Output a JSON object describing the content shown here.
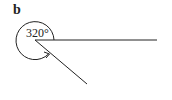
{
  "figure": {
    "label": "b",
    "angle_label": "320°",
    "angle_degrees": 320,
    "stroke_color": "#222222",
    "background": "#ffffff",
    "vertex": [
      35,
      40
    ],
    "ray_horizontal_end": [
      157,
      40
    ],
    "ray_diagonal_end": [
      87,
      84
    ]
  }
}
